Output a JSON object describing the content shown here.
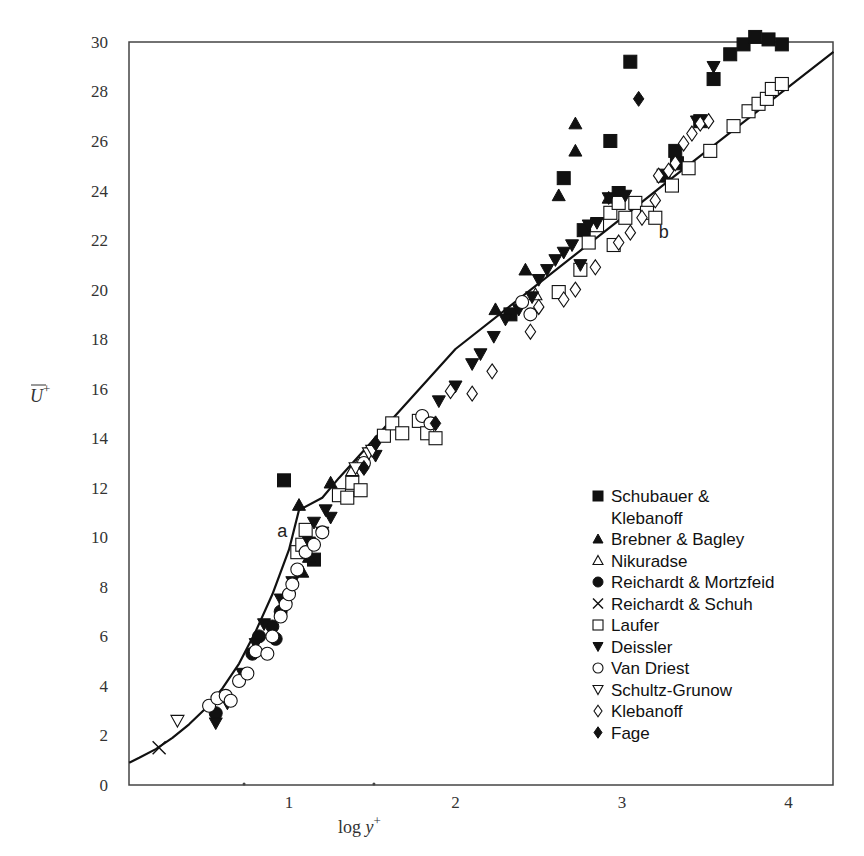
{
  "chart_data": {
    "type": "scatter",
    "title": "",
    "xlabel": "log y+",
    "ylabel": "U+",
    "xlim": [
      0.04,
      4.27
    ],
    "ylim": [
      0,
      30
    ],
    "grid": false,
    "legend_position": "lower right (inside)",
    "x_ticks": [
      1,
      2,
      3,
      4
    ],
    "y_ticks": [
      0,
      2,
      4,
      6,
      8,
      10,
      12,
      14,
      16,
      18,
      20,
      22,
      24,
      26,
      28,
      30
    ],
    "annotations": [
      {
        "text": "a",
        "x": 0.93,
        "y": 10.0
      },
      {
        "text": "b",
        "x": 3.22,
        "y": 22.1
      }
    ],
    "curves": [
      {
        "name": "law of the wall (a: viscous sublayer U+=y+, b: log law)",
        "points": [
          [
            0.04,
            0.9
          ],
          [
            0.1,
            1.1
          ],
          [
            0.2,
            1.45
          ],
          [
            0.3,
            1.9
          ],
          [
            0.4,
            2.45
          ],
          [
            0.5,
            3.1
          ],
          [
            0.6,
            3.9
          ],
          [
            0.7,
            4.9
          ],
          [
            0.8,
            6.2
          ],
          [
            0.9,
            7.7
          ],
          [
            1.0,
            9.5
          ],
          [
            1.06,
            11.1
          ],
          [
            1.2,
            11.6
          ],
          [
            1.3,
            12.4
          ],
          [
            2.0,
            17.6
          ],
          [
            3.0,
            22.9
          ],
          [
            3.3,
            24.5
          ],
          [
            4.27,
            29.6
          ]
        ]
      }
    ],
    "series": [
      {
        "name": "Schubauer & Klebanoff",
        "marker": "filled-square",
        "points": [
          [
            0.97,
            12.3
          ],
          [
            1.15,
            9.1
          ],
          [
            2.33,
            19.0
          ],
          [
            2.65,
            24.5
          ],
          [
            2.77,
            22.4
          ],
          [
            2.93,
            26.0
          ],
          [
            3.05,
            29.2
          ],
          [
            3.25,
            24.6
          ],
          [
            3.32,
            25.6
          ],
          [
            3.33,
            25.1
          ],
          [
            3.47,
            26.8
          ],
          [
            3.55,
            28.5
          ],
          [
            3.65,
            29.5
          ],
          [
            3.73,
            29.9
          ],
          [
            3.8,
            30.2
          ],
          [
            3.88,
            30.1
          ],
          [
            3.96,
            29.9
          ],
          [
            2.98,
            23.9
          ]
        ]
      },
      {
        "name": "Brebner & Bagley",
        "marker": "filled-triangle-up",
        "points": [
          [
            1.06,
            11.3
          ],
          [
            1.25,
            12.2
          ],
          [
            1.12,
            9.2
          ],
          [
            1.08,
            8.6
          ],
          [
            2.24,
            19.2
          ],
          [
            2.42,
            20.8
          ],
          [
            2.62,
            23.8
          ],
          [
            2.72,
            25.6
          ],
          [
            2.72,
            26.7
          ],
          [
            2.92,
            23.7
          ]
        ]
      },
      {
        "name": "Nikuradse",
        "marker": "open-triangle-up",
        "points": [
          [
            1.38,
            12.7
          ],
          [
            1.42,
            13.0
          ],
          [
            2.48,
            19.8
          ]
        ]
      },
      {
        "name": "Reichardt & Mortzfeid",
        "marker": "filled-circle",
        "points": [
          [
            0.56,
            2.9
          ],
          [
            0.78,
            5.3
          ],
          [
            0.82,
            6.0
          ],
          [
            0.9,
            6.4
          ],
          [
            0.92,
            5.9
          ],
          [
            0.95,
            7.0
          ]
        ]
      },
      {
        "name": "Reichardt & Schuh",
        "marker": "cross",
        "points": [
          [
            0.22,
            1.5
          ]
        ]
      },
      {
        "name": "Laufer",
        "marker": "open-square",
        "points": [
          [
            1.05,
            9.4
          ],
          [
            1.1,
            10.3
          ],
          [
            1.08,
            9.7
          ],
          [
            1.3,
            11.7
          ],
          [
            1.35,
            11.6
          ],
          [
            1.38,
            12.2
          ],
          [
            1.43,
            11.9
          ],
          [
            1.57,
            14.1
          ],
          [
            1.62,
            14.6
          ],
          [
            1.68,
            14.2
          ],
          [
            1.78,
            14.7
          ],
          [
            1.83,
            14.2
          ],
          [
            1.88,
            14.0
          ],
          [
            2.62,
            19.9
          ],
          [
            2.75,
            20.8
          ],
          [
            2.8,
            21.9
          ],
          [
            2.85,
            22.6
          ],
          [
            2.93,
            23.1
          ],
          [
            2.98,
            23.5
          ],
          [
            2.95,
            21.8
          ],
          [
            3.02,
            22.9
          ],
          [
            3.08,
            23.5
          ],
          [
            3.15,
            23.1
          ],
          [
            3.2,
            22.9
          ],
          [
            3.3,
            24.2
          ],
          [
            3.4,
            24.9
          ],
          [
            3.53,
            25.6
          ],
          [
            3.67,
            26.6
          ],
          [
            3.76,
            27.2
          ],
          [
            3.82,
            27.5
          ],
          [
            3.87,
            27.7
          ],
          [
            3.9,
            28.1
          ],
          [
            3.96,
            28.3
          ]
        ]
      },
      {
        "name": "Deissler",
        "marker": "filled-triangle-down",
        "points": [
          [
            0.56,
            2.5
          ],
          [
            0.63,
            3.3
          ],
          [
            0.72,
            4.5
          ],
          [
            0.8,
            5.7
          ],
          [
            0.85,
            6.5
          ],
          [
            0.95,
            7.5
          ],
          [
            1.02,
            8.2
          ],
          [
            1.12,
            9.8
          ],
          [
            1.15,
            10.6
          ],
          [
            1.2,
            10.2
          ],
          [
            1.22,
            11.1
          ],
          [
            1.25,
            10.8
          ],
          [
            1.52,
            13.3
          ],
          [
            1.9,
            15.5
          ],
          [
            2.0,
            16.1
          ],
          [
            2.1,
            17.0
          ],
          [
            2.15,
            17.4
          ],
          [
            2.23,
            18.1
          ],
          [
            2.3,
            18.8
          ],
          [
            2.38,
            19.2
          ],
          [
            2.46,
            19.7
          ],
          [
            2.5,
            20.4
          ],
          [
            2.55,
            20.8
          ],
          [
            2.6,
            21.2
          ],
          [
            2.65,
            21.5
          ],
          [
            2.7,
            21.8
          ],
          [
            2.75,
            21.0
          ],
          [
            2.8,
            22.6
          ],
          [
            2.85,
            22.7
          ],
          [
            2.92,
            23.7
          ],
          [
            3.02,
            23.8
          ],
          [
            3.45,
            26.8
          ],
          [
            3.55,
            29.0
          ]
        ]
      },
      {
        "name": "Van Driest",
        "marker": "open-circle",
        "points": [
          [
            0.52,
            3.2
          ],
          [
            0.57,
            3.5
          ],
          [
            0.62,
            3.6
          ],
          [
            0.65,
            3.4
          ],
          [
            0.7,
            4.2
          ],
          [
            0.75,
            4.5
          ],
          [
            0.8,
            5.4
          ],
          [
            0.87,
            5.3
          ],
          [
            0.9,
            6.0
          ],
          [
            0.95,
            6.8
          ],
          [
            0.98,
            7.3
          ],
          [
            1.0,
            7.7
          ],
          [
            1.02,
            8.1
          ],
          [
            1.05,
            8.7
          ],
          [
            1.1,
            9.4
          ],
          [
            1.15,
            9.7
          ],
          [
            1.2,
            10.2
          ],
          [
            1.45,
            13.0
          ],
          [
            1.8,
            14.9
          ],
          [
            1.85,
            14.6
          ],
          [
            2.4,
            19.5
          ],
          [
            2.45,
            19.0
          ]
        ]
      },
      {
        "name": "Schultz-Grunow",
        "marker": "open-triangle-down",
        "points": [
          [
            0.33,
            2.6
          ],
          [
            1.4,
            12.8
          ],
          [
            1.48,
            13.4
          ],
          [
            1.5,
            13.5
          ]
        ]
      },
      {
        "name": "Klebanoff",
        "marker": "open-diamond",
        "points": [
          [
            1.97,
            15.9
          ],
          [
            2.1,
            15.8
          ],
          [
            2.22,
            16.7
          ],
          [
            2.45,
            18.3
          ],
          [
            2.5,
            19.3
          ],
          [
            2.65,
            19.6
          ],
          [
            2.72,
            20.0
          ],
          [
            2.84,
            20.9
          ],
          [
            2.98,
            21.9
          ],
          [
            3.05,
            22.3
          ],
          [
            3.12,
            22.9
          ],
          [
            3.2,
            23.6
          ],
          [
            3.22,
            24.6
          ],
          [
            3.28,
            24.8
          ],
          [
            3.32,
            25.1
          ],
          [
            3.37,
            25.9
          ],
          [
            3.42,
            26.3
          ],
          [
            3.47,
            26.7
          ],
          [
            3.52,
            26.8
          ]
        ]
      },
      {
        "name": "Fage",
        "marker": "filled-diamond",
        "points": [
          [
            1.45,
            12.8
          ],
          [
            1.88,
            14.6
          ],
          [
            1.52,
            13.8
          ],
          [
            3.1,
            27.7
          ]
        ]
      }
    ]
  },
  "legend": {
    "items": [
      {
        "label": "Schubauer &",
        "label2": "Klebanoff",
        "marker": "filled-square"
      },
      {
        "label": "Brebner & Bagley",
        "marker": "filled-triangle-up"
      },
      {
        "label": "Nikuradse",
        "marker": "open-triangle-up"
      },
      {
        "label": "Reichardt & Mortzfeid",
        "marker": "filled-circle"
      },
      {
        "label": "Reichardt & Schuh",
        "marker": "cross"
      },
      {
        "label": "Laufer",
        "marker": "open-square"
      },
      {
        "label": "Deissler",
        "marker": "filled-triangle-down"
      },
      {
        "label": "Van Driest",
        "marker": "open-circle"
      },
      {
        "label": "Schultz-Grunow",
        "marker": "open-triangle-down"
      },
      {
        "label": "Klebanoff",
        "marker": "open-diamond"
      },
      {
        "label": "Fage",
        "marker": "filled-diamond"
      }
    ]
  },
  "axes": {
    "x_title_main": "log ",
    "x_title_var": "y",
    "x_title_sup": "+",
    "y_title_var": "U",
    "y_title_sup": "+"
  },
  "colors": {
    "ink": "#111111",
    "frame": "#444444",
    "fill_open": "#ffffff"
  }
}
